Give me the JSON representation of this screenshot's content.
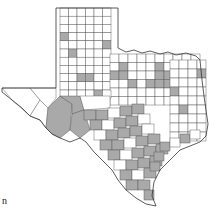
{
  "figure": {
    "corner_label": "n",
    "colors": {
      "highlighted": "#a9a9a9",
      "default": "#ffffff",
      "border": "#555555",
      "outline": "#333333"
    },
    "legend": {
      "highlighted_meaning": "shaded county",
      "default_meaning": "unshaded county"
    },
    "regions": {
      "panhandle": "mostly unshaded, a few shaded counties",
      "north_central": "scattered shaded counties",
      "east": "mostly unshaded",
      "west_trans_pecos": "shaded block along Pecos/Big Bend area",
      "central_south": "many shaded counties",
      "gulf_coast": "many shaded coastal counties",
      "south_tip": "shaded Rio Grande valley counties"
    }
  }
}
